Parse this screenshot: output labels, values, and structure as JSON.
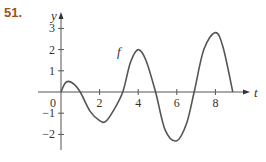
{
  "problem_number": "51.",
  "chart_data": {
    "type": "line",
    "title": "",
    "xlabel": "t",
    "ylabel": "y",
    "curve_label": "f",
    "xlim": [
      0,
      9.8
    ],
    "ylim": [
      -2.8,
      3.8
    ],
    "x_ticks": [
      2,
      4,
      6,
      8
    ],
    "x_tick_labels": [
      "2",
      "4",
      "6",
      "8"
    ],
    "y_ticks": [
      -2,
      -1,
      1,
      2,
      3
    ],
    "y_tick_labels": [
      "−2",
      "−1",
      "1",
      "2",
      "3"
    ],
    "origin_label": "0",
    "grid": false,
    "legend": "none",
    "series": [
      {
        "name": "f",
        "x": [
          0,
          0.2,
          0.4,
          0.7,
          1.0,
          1.5,
          2.0,
          2.3,
          2.7,
          3.2,
          3.6,
          4.0,
          4.4,
          4.9,
          5.4,
          6.0,
          6.5,
          6.9,
          7.4,
          8.0,
          8.4,
          8.9
        ],
        "values": [
          0,
          0.4,
          0.5,
          0.35,
          0,
          -0.9,
          -1.35,
          -1.4,
          -0.9,
          0,
          1.4,
          2.0,
          1.5,
          0,
          -1.8,
          -2.3,
          -1.5,
          0,
          2.0,
          2.8,
          2.1,
          0
        ]
      }
    ]
  }
}
